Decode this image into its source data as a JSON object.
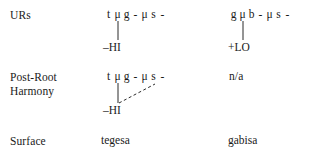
{
  "figure": {
    "type": "autosegmental-derivation",
    "rows": [
      {
        "id": "urs",
        "label": "URs",
        "columns": [
          {
            "id": "urs-col1",
            "segments": [
              "t",
              "μ",
              "g",
              "-",
              "μ",
              "s",
              "-"
            ],
            "feature": "–HI",
            "associations": [
              {
                "type": "solid",
                "from_segment_index": 1,
                "to": "feature"
              }
            ]
          },
          {
            "id": "urs-col2",
            "segments": [
              "g",
              "μ",
              "b",
              "-",
              "μ",
              "s",
              "-"
            ],
            "feature": "+LO",
            "associations": [
              {
                "type": "solid",
                "from_segment_index": 1,
                "to": "feature"
              }
            ]
          }
        ]
      },
      {
        "id": "post-root-harmony",
        "label": "Post-Root",
        "label_line2": "Harmony",
        "columns": [
          {
            "id": "prh-col1",
            "segments": [
              "t",
              "μ",
              "g",
              "-",
              "μ",
              "s",
              "-"
            ],
            "feature": "–HI",
            "associations": [
              {
                "type": "solid",
                "from_segment_index": 1,
                "to": "feature"
              },
              {
                "type": "dashed",
                "from_segment_index": 4,
                "to": "feature"
              }
            ]
          },
          {
            "id": "prh-col2",
            "not_applicable": "n/a",
            "segments": [],
            "feature": "",
            "associations": []
          }
        ]
      },
      {
        "id": "surface",
        "label": "Surface",
        "columns": [
          {
            "id": "surface-col1",
            "form": "tegesa"
          },
          {
            "id": "surface-col2",
            "form": "gabisa"
          }
        ]
      }
    ]
  },
  "style": {
    "text_color": "#1a1a1a",
    "line_color": "#2b2b2b",
    "background": "#ffffff"
  }
}
